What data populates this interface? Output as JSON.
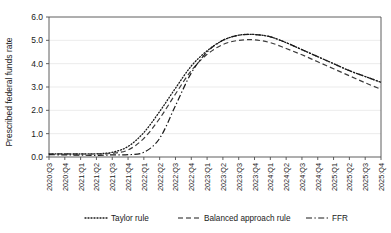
{
  "chart_data": {
    "type": "line",
    "title": "",
    "xlabel": "",
    "ylabel": "Prescribed federal funds rate",
    "ylim": [
      0.0,
      6.0
    ],
    "yticks": [
      "0.0",
      "1.0",
      "2.0",
      "3.0",
      "4.0",
      "5.0",
      "6.0"
    ],
    "ytick_values": [
      0.0,
      1.0,
      2.0,
      3.0,
      4.0,
      5.0,
      6.0
    ],
    "grid": "horizontal",
    "legend_position": "bottom",
    "categories": [
      "2020:Q3",
      "2020:Q4",
      "2021:Q1",
      "2021:Q2",
      "2021:Q3",
      "2021:Q4",
      "2022:Q1",
      "2022:Q2",
      "2022:Q3",
      "2022:Q4",
      "2023:Q1",
      "2023:Q2",
      "2023:Q3",
      "2023:Q4",
      "2024:Q1",
      "2024:Q2",
      "2024:Q3",
      "2024:Q4",
      "2025:Q1",
      "2025:Q2",
      "2025:Q3",
      "2025:Q4"
    ],
    "series": [
      {
        "name": "Taylor rule",
        "style": "dotted",
        "color": "#1a1a1a",
        "values": [
          0.13,
          0.13,
          0.13,
          0.14,
          0.2,
          0.45,
          1.05,
          1.95,
          2.95,
          3.9,
          4.55,
          5.0,
          5.22,
          5.25,
          5.15,
          4.9,
          4.6,
          4.3,
          4.0,
          3.7,
          3.45,
          3.2
        ]
      },
      {
        "name": "Balanced approach rule",
        "style": "dashed",
        "color": "#3a3a3a",
        "values": [
          0.13,
          0.13,
          0.13,
          0.13,
          0.16,
          0.3,
          0.8,
          1.65,
          2.7,
          3.7,
          4.4,
          4.82,
          5.0,
          5.02,
          4.9,
          4.65,
          4.38,
          4.08,
          3.78,
          3.48,
          3.18,
          2.9
        ]
      },
      {
        "name": "FFR",
        "style": "dashdot",
        "color": "#1a1a1a",
        "values": [
          0.1,
          0.09,
          0.08,
          0.07,
          0.09,
          0.1,
          0.2,
          0.8,
          2.2,
          3.6,
          4.5,
          5.0,
          5.22,
          5.25,
          5.15,
          4.9,
          4.6,
          4.3,
          4.0,
          3.7,
          3.45,
          3.2
        ]
      }
    ],
    "legend": [
      {
        "label": "Taylor rule",
        "style": "dotted"
      },
      {
        "label": "Balanced approach rule",
        "style": "dashed"
      },
      {
        "label": "FFR",
        "style": "dashdot"
      }
    ],
    "colors": {
      "axis": "#4d4d4d",
      "grid": "#e6e6e6",
      "text": "#1a1a1a",
      "background": "#ffffff"
    }
  }
}
